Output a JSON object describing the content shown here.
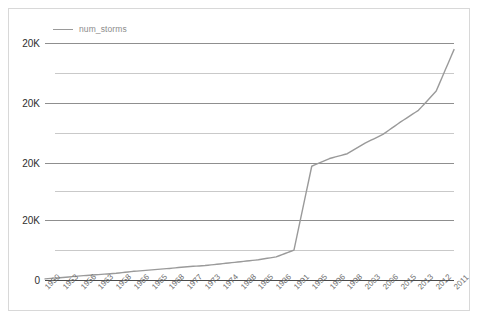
{
  "legend": {
    "position": "top-left",
    "entries": [
      {
        "label": "num_storms",
        "color": "#9a9a9a",
        "marker": "line-swatch-icon"
      }
    ]
  },
  "axes": {
    "y_ticks": [
      "20K",
      "20K",
      "20K",
      "20K",
      "0"
    ],
    "x_ticks": [
      "1950",
      "1953",
      "1956",
      "1963",
      "1958",
      "1966",
      "1965",
      "1968",
      "1977",
      "1973",
      "1974",
      "1988",
      "1985",
      "1986",
      "1991",
      "1995",
      "1996",
      "1998",
      "2003",
      "2006",
      "2015",
      "2013",
      "2012",
      "2011"
    ]
  },
  "chart_data": {
    "type": "line",
    "title": "",
    "xlabel": "",
    "ylabel": "",
    "grid": true,
    "legend_position": "top-left",
    "ylim": [
      0,
      25000
    ],
    "ytick_values": [
      5000,
      10000,
      15000,
      20000,
      0
    ],
    "ytick_labels": [
      "20K",
      "20K",
      "20K",
      "20K",
      "0"
    ],
    "categories": [
      "1950",
      "1953",
      "1956",
      "1963",
      "1958",
      "1966",
      "1965",
      "1968",
      "1977",
      "1973",
      "1974",
      "1988",
      "1985",
      "1986",
      "1991",
      "1995",
      "1996",
      "1998",
      "2003",
      "2006",
      "2015",
      "2013",
      "2012",
      "2011"
    ],
    "series": [
      {
        "name": "num_storms",
        "color": "#9a9a9a",
        "values": [
          120,
          260,
          430,
          560,
          700,
          900,
          1050,
          1200,
          1380,
          1500,
          1700,
          1900,
          2100,
          2400,
          3100,
          11800,
          12600,
          13100,
          14200,
          15100,
          16400,
          17600,
          19600,
          23900
        ]
      }
    ]
  },
  "plot_geometry": {
    "gridline_count": 9,
    "major_gridline_y": [
      34,
      94,
      154,
      211,
      271
    ],
    "minor_gridline_y": [
      64,
      124,
      182,
      241
    ]
  }
}
